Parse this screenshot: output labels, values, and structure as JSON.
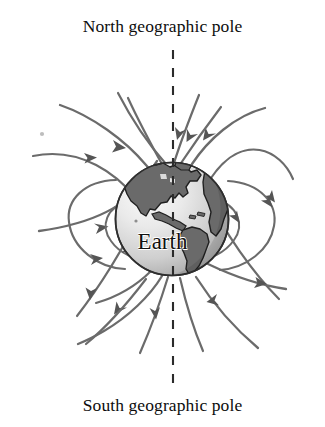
{
  "figure": {
    "title_top": "North geographic pole",
    "title_bottom": "South geographic pole",
    "center_label": "Earth",
    "axis": {
      "name": "rotation-axis",
      "style": "dashed",
      "color": "#2b2b2b",
      "x": 173,
      "y_top": 50,
      "y_bottom": 388
    },
    "globe": {
      "center_x": 172,
      "center_y": 219,
      "radius": 57,
      "ocean_light": "#f0f0f0",
      "ocean_mid": "#d0d0d0",
      "ocean_shadow": "#9a9a9a",
      "land_color": "#6e6e6e",
      "outline_color": "#2e2e2e"
    },
    "field_lines": {
      "color": "#6b6b6b",
      "arrow_color": "#555555",
      "count": 16,
      "description": "Dipole magnetic field lines of Earth, arrows directed from the south geographic pole side around to the north geographic pole side"
    },
    "speck": {
      "x": 42,
      "y": 134,
      "color": "#b9b9b9"
    }
  }
}
